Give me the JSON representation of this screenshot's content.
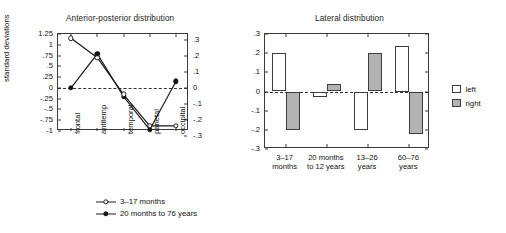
{
  "chart_data": [
    {
      "type": "line",
      "title": "Anterior-posterior distribution",
      "xlabel": "",
      "ylabel": "standard deviations",
      "categories": [
        "frontal",
        "antitemp",
        "temporal",
        "parietal",
        "occipital"
      ],
      "ylim": [
        -1,
        1.25
      ],
      "yticks": [
        "1.25",
        "1",
        ".75",
        ".5",
        ".25",
        "0",
        "-.25",
        "-.5",
        "-.75",
        "-1"
      ],
      "ytick_values": [
        1.25,
        1,
        0.75,
        0.5,
        0.25,
        0,
        -0.25,
        -0.5,
        -0.75,
        -1
      ],
      "y2lim": [
        -0.3,
        0.3
      ],
      "y2ticks": [
        ".3",
        ".2",
        ".1",
        "0",
        "-.1",
        "-.2",
        "-.3"
      ],
      "y2tick_values": [
        0.3,
        0.2,
        0.1,
        0,
        -0.1,
        -0.2,
        -0.3
      ],
      "grid": false,
      "zero_reference_line": true,
      "legend_position": "below",
      "series": [
        {
          "name": "3-17 months",
          "marker": "open-circle",
          "values": [
            1.15,
            0.7,
            -0.15,
            -0.88,
            -0.88
          ]
        },
        {
          "name": "20 months to 76 years",
          "marker": "filled-circle",
          "values": [
            0.0,
            0.79,
            -0.2,
            -0.97,
            0.15
          ]
        }
      ]
    },
    {
      "type": "bar",
      "title": "Lateral distribution",
      "xlabel": "",
      "ylabel": "",
      "categories": [
        "3–17\nmonths",
        "20 months\nto 12 years",
        "13–26\nyears",
        "60–76\nyears"
      ],
      "ylim": [
        -0.3,
        0.3
      ],
      "yticks": [
        ".3",
        ".2",
        ".1",
        "0",
        "-.1",
        "-.2",
        "-.3"
      ],
      "ytick_values": [
        0.3,
        0.2,
        0.1,
        0,
        -0.1,
        -0.2,
        -0.3
      ],
      "grid": false,
      "zero_reference_line": true,
      "legend_position": "right",
      "series": [
        {
          "name": "left",
          "color": "#ffffff",
          "values": [
            0.2,
            -0.03,
            -0.2,
            0.24
          ]
        },
        {
          "name": "right",
          "color": "#b3b3b3",
          "values": [
            -0.2,
            0.04,
            0.2,
            -0.22
          ]
        }
      ]
    }
  ],
  "left_chart": {
    "title": "Anterior-posterior distribution",
    "ylabel": "standard deviations",
    "legend": [
      {
        "label": "3–17 months",
        "marker": "open-circle"
      },
      {
        "label": "20 months to 76 years",
        "marker": "filled-circle"
      }
    ]
  },
  "right_chart": {
    "title": "Lateral distribution",
    "legend": [
      {
        "label": "left",
        "swatch": "white"
      },
      {
        "label": "right",
        "swatch": "gray"
      }
    ]
  },
  "colors": {
    "axis": "#3a3a3a",
    "bar_left": "#ffffff",
    "bar_right": "#b3b3b3",
    "line": "#1a1a1a",
    "text": "#111111"
  }
}
